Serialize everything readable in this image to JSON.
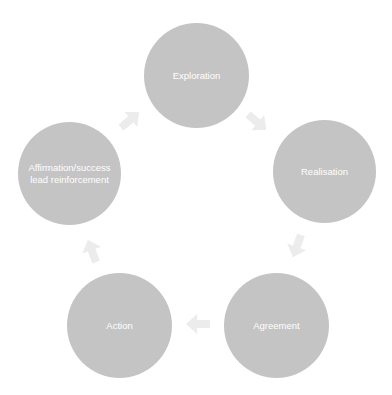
{
  "diagram": {
    "type": "cycle",
    "colors": {
      "node_fill": "#c4c4c4",
      "node_text": "#ffffff",
      "arrow_fill": "#ececec",
      "background": "#ffffff"
    },
    "nodes": [
      {
        "id": "exploration",
        "label": "Exploration"
      },
      {
        "id": "realisation",
        "label": "Realisation"
      },
      {
        "id": "agreement",
        "label": "Agreement"
      },
      {
        "id": "action",
        "label": "Action"
      },
      {
        "id": "affirmation",
        "label": "Affirmation/success\nlead reinforcement"
      }
    ],
    "edges": [
      {
        "from": "exploration",
        "to": "realisation"
      },
      {
        "from": "realisation",
        "to": "agreement"
      },
      {
        "from": "agreement",
        "to": "action"
      },
      {
        "from": "action",
        "to": "affirmation"
      },
      {
        "from": "affirmation",
        "to": "exploration"
      }
    ]
  }
}
